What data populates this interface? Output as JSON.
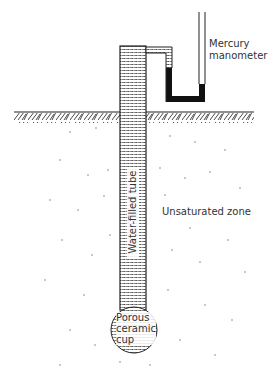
{
  "diagram": {
    "labels": {
      "manometer_line1": "Mercury",
      "manometer_line2": "manometer",
      "unsaturated_zone": "Unsaturated zone",
      "tube": "Water-filled tube",
      "cup_line1": "Porous",
      "cup_line2": "ceramic",
      "cup_line3": "cup"
    },
    "components": [
      "ground-surface",
      "water-filled-tube",
      "mercury-manometer",
      "porous-ceramic-cup",
      "unsaturated-zone"
    ],
    "colors": {
      "line": "#222222",
      "mercury": "#111111",
      "background": "#ffffff"
    }
  }
}
